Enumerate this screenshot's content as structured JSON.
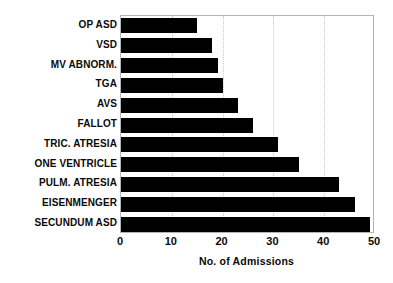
{
  "chart_data": {
    "type": "bar",
    "orientation": "horizontal",
    "title": "",
    "xlabel": "No. of Admissions",
    "ylabel": "",
    "xlim": [
      0,
      50
    ],
    "xticks": [
      0,
      10,
      20,
      30,
      40,
      50
    ],
    "xtick_labels": [
      "0",
      "10",
      "20",
      "30",
      "40",
      "50"
    ],
    "grid": "vertical dotted gridlines at 10, 20, 30, 40",
    "legend": "none",
    "bar_color": "#000000",
    "background_color": "#ffffff",
    "categories": [
      "OP ASD",
      "VSD",
      "MV ABNORM.",
      "TGA",
      "AVS",
      "FALLOT",
      "TRIC. ATRESIA",
      "ONE VENTRICLE",
      "PULM. ATRESIA",
      "EISENMENGER",
      "SECUNDUM ASD"
    ],
    "values": [
      15,
      18,
      19,
      20,
      23,
      26,
      31,
      35,
      43,
      46,
      49
    ]
  }
}
